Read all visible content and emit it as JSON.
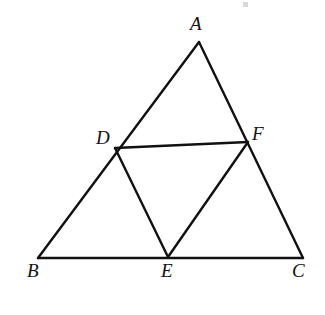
{
  "figure": {
    "name": "triangle-abc-with-medial-triangle-def",
    "background_color": "#ffffff",
    "stroke_color": "#111111",
    "stroke_width": 2.4,
    "canvas": {
      "width": 325,
      "height": 315
    }
  },
  "points": {
    "A": {
      "label": "A",
      "x": 199,
      "y": 42,
      "label_x": 190,
      "label_y": 14
    },
    "B": {
      "label": "B",
      "x": 38,
      "y": 258,
      "label_x": 27,
      "label_y": 261
    },
    "C": {
      "label": "C",
      "x": 303,
      "y": 258,
      "label_x": 292,
      "label_y": 261
    },
    "D": {
      "label": "D",
      "x": 115,
      "y": 148,
      "label_x": 96,
      "label_y": 128
    },
    "E": {
      "label": "E",
      "x": 168,
      "y": 257,
      "label_x": 161,
      "label_y": 261
    },
    "F": {
      "label": "F",
      "x": 248,
      "y": 142,
      "label_x": 252,
      "label_y": 124
    }
  },
  "segments": [
    {
      "name": "segment-AB",
      "from": "A",
      "to": "B"
    },
    {
      "name": "segment-AC",
      "from": "A",
      "to": "C"
    },
    {
      "name": "segment-BC",
      "from": "B",
      "to": "C"
    },
    {
      "name": "segment-DF",
      "from": "D",
      "to": "F"
    },
    {
      "name": "segment-DE",
      "from": "D",
      "to": "E"
    },
    {
      "name": "segment-EF",
      "from": "E",
      "to": "F"
    }
  ]
}
